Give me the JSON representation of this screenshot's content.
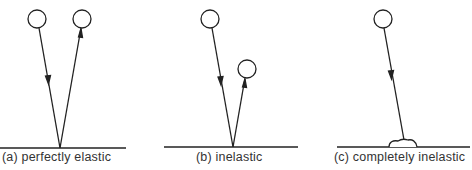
{
  "panels": [
    {
      "id": "a",
      "caption": "(a) perfectly elastic"
    },
    {
      "id": "b",
      "caption": "(b) inelastic"
    },
    {
      "id": "c",
      "caption": "(c) completely inelastic"
    }
  ],
  "colors": {
    "stroke": "#222222",
    "text": "#333333",
    "background": "#ffffff"
  }
}
